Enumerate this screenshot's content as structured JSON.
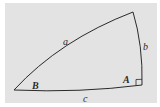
{
  "diagram": {
    "type": "spherical-right-triangle",
    "sides": {
      "a": "a",
      "b": "b",
      "c": "c"
    },
    "angles": {
      "A": "A",
      "B": "B"
    },
    "right_angle_marker": true,
    "colors": {
      "background": "#e3e3e3",
      "stroke": "#2a2a2a"
    }
  }
}
